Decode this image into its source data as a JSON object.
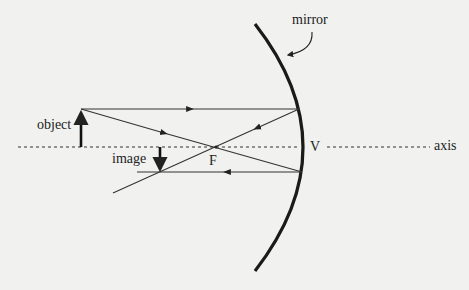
{
  "diagram": {
    "labels": {
      "mirror": "mirror",
      "object": "object",
      "image": "image",
      "focal_point": "F",
      "vertex": "V",
      "axis": "axis"
    },
    "colors": {
      "background": "#f1f1ef",
      "ink": "#222222"
    },
    "geometry": {
      "axis_y": 147,
      "object": {
        "x": 81,
        "base_y": 147,
        "tip_y": 109
      },
      "image": {
        "x": 160,
        "base_y": 147,
        "tip_y": 172
      },
      "focal_point": {
        "x": 216,
        "y": 147
      },
      "mirror_top": {
        "x": 255,
        "y": 24
      },
      "mirror_vertex": {
        "x": 303,
        "y": 147
      },
      "mirror_bottom": {
        "x": 255,
        "y": 271
      }
    },
    "rays": [
      {
        "name": "parallel-incident-ray",
        "from": [
          81,
          109
        ],
        "to": [
          299,
          109
        ],
        "arrow": "right"
      },
      {
        "name": "reflected-through-focus-ray",
        "from": [
          299,
          109
        ],
        "to": [
          113,
          193
        ],
        "arrow": "down-left"
      },
      {
        "name": "focus-incident-ray",
        "from": [
          81,
          109
        ],
        "to": [
          302,
          172
        ],
        "arrow": "right"
      },
      {
        "name": "reflected-parallel-ray",
        "from": [
          302,
          172
        ],
        "to": [
          137,
          172
        ],
        "arrow": "left"
      }
    ]
  }
}
